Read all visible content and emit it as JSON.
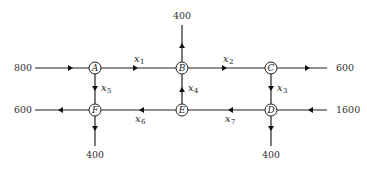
{
  "nodes": [
    {
      "id": "A",
      "label": "A"
    },
    {
      "id": "B",
      "label": "B"
    },
    {
      "id": "C",
      "label": "C"
    },
    {
      "id": "D",
      "label": "D"
    },
    {
      "id": "E",
      "label": "E"
    },
    {
      "id": "F",
      "label": "F"
    }
  ],
  "edges": [
    {
      "id": "x1",
      "from": "A",
      "to": "B",
      "var": "x",
      "sub": "1"
    },
    {
      "id": "x2",
      "from": "B",
      "to": "C",
      "var": "x",
      "sub": "2"
    },
    {
      "id": "x3",
      "from": "C",
      "to": "D",
      "var": "x",
      "sub": "3"
    },
    {
      "id": "x4",
      "from": "E",
      "to": "B",
      "var": "x",
      "sub": "4"
    },
    {
      "id": "x5",
      "from": "A",
      "to": "F",
      "var": "x",
      "sub": "5"
    },
    {
      "id": "x6",
      "from": "E",
      "to": "F",
      "var": "x",
      "sub": "6"
    },
    {
      "id": "x7",
      "from": "D",
      "to": "E",
      "var": "x",
      "sub": "7"
    }
  ],
  "external_flows": [
    {
      "id": "in-A",
      "node": "A",
      "direction": "in",
      "value": "800"
    },
    {
      "id": "out-B",
      "node": "B",
      "direction": "out",
      "value": "400"
    },
    {
      "id": "out-C",
      "node": "C",
      "direction": "out",
      "value": "600"
    },
    {
      "id": "in-D",
      "node": "D",
      "direction": "in",
      "value": "1600"
    },
    {
      "id": "out-D",
      "node": "D",
      "direction": "out",
      "value": "400"
    },
    {
      "id": "out-F-left",
      "node": "F",
      "direction": "out",
      "value": "600"
    },
    {
      "id": "out-F-down",
      "node": "F",
      "direction": "out",
      "value": "400"
    }
  ]
}
